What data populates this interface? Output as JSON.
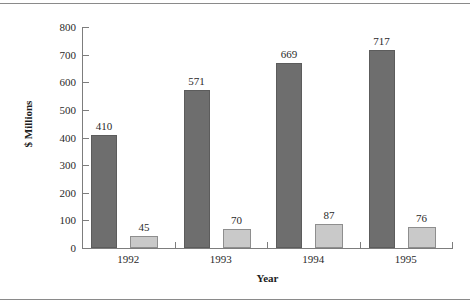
{
  "chart_data": {
    "type": "bar",
    "title": "",
    "xlabel": "Year",
    "ylabel": "$ Millions",
    "categories": [
      "1992",
      "1993",
      "1994",
      "1995"
    ],
    "series": [
      {
        "name": "series-dark",
        "color": "#6e6e6e",
        "values": [
          410,
          571,
          669,
          717
        ]
      },
      {
        "name": "series-light",
        "color": "#c9c9c9",
        "values": [
          45,
          70,
          87,
          76
        ]
      }
    ],
    "ylim": [
      0,
      800
    ],
    "yticks": [
      0,
      100,
      200,
      300,
      400,
      500,
      600,
      700,
      800
    ],
    "ytick_labels": [
      "0",
      "100",
      "200",
      "300",
      "400",
      "500",
      "600",
      "700",
      "800"
    ],
    "grid": false,
    "legend": "none",
    "data_labels": {
      "dark": [
        "410",
        "571",
        "669",
        "717"
      ],
      "light": [
        "45",
        "70",
        "87",
        "76"
      ]
    }
  }
}
